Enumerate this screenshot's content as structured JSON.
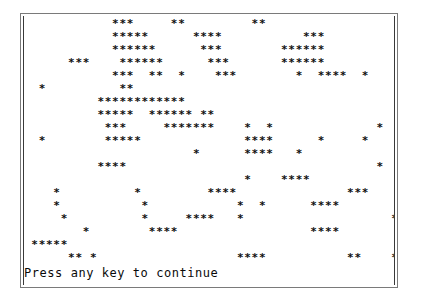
{
  "window": {
    "kind": "text-mode-console-window",
    "border_color_outer": "#7a7a7a",
    "border_color_inner": "#3a3a3a",
    "background_color": "#ffffff",
    "foreground_color": "#101010",
    "columns": 60,
    "rows": 18
  },
  "grid": {
    "cell_character": "*",
    "blank_character": " ",
    "rows": [
      "            ***     **         **                           ",
      "            *****      ****           ***                   ",
      "            ******      ***        ******                   ",
      "      ***    ******      ***       ******                   ",
      "            ***  **  *    ***        *  ****  *             ",
      "  *          **                                             ",
      "          ************                                      ",
      "          *****  ****** **                                  ",
      "           ***     *******    *  *              *           ",
      "  *        *****              ****      *     *      *      ",
      "                       *      ****   *              *       ",
      "          ****                                  *  **       ",
      "                              *    ****                     ",
      "    *          *         ****               ***             ",
      "    *           *            *  *      ****                 ",
      "     *          *     ****   *                    *         ",
      "        *        ****                  ****         ***     ",
      " *****                                                      ",
      "      ** *                   ****           **    *  **     "
    ]
  },
  "prompt": {
    "text": "Press any key to continue",
    "row_index": 19
  }
}
